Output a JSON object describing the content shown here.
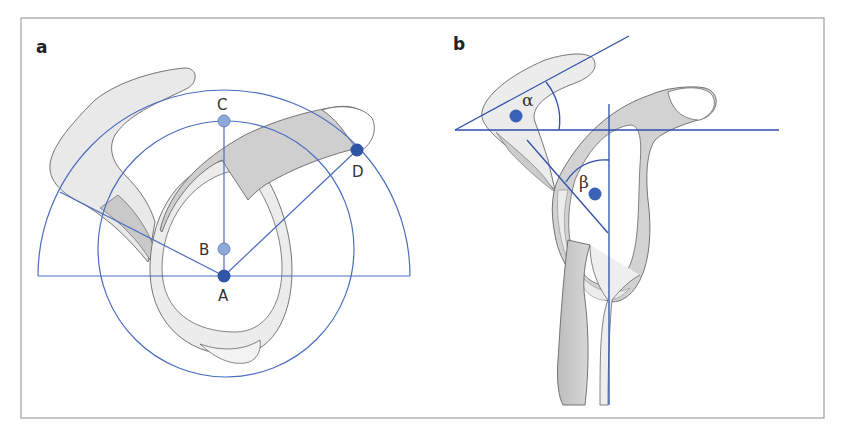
{
  "figure": {
    "panels": [
      {
        "id": "a",
        "label": "a",
        "points": [
          {
            "name": "A",
            "label": "A",
            "color": "#2f55a4"
          },
          {
            "name": "B",
            "label": "B",
            "color": "#8ea8d8"
          },
          {
            "name": "C",
            "label": "C",
            "color": "#8ea8d8"
          },
          {
            "name": "D",
            "label": "D",
            "color": "#2f55a4"
          }
        ]
      },
      {
        "id": "b",
        "label": "b",
        "angles": [
          {
            "name": "alpha",
            "label": "α"
          },
          {
            "name": "beta",
            "label": "β"
          }
        ]
      }
    ],
    "colors": {
      "line_blue": "#4a6cc0",
      "dark_dot": "#2f55a4",
      "light_dot": "#8ea8d8",
      "bone_fill": "#ebebeb",
      "bone_shade": "#c9c9c9",
      "outline": "#666666",
      "frame": "#999999"
    }
  }
}
